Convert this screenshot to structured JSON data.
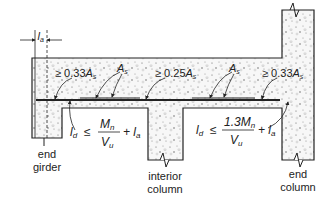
{
  "diagram": {
    "dimension_label": "l",
    "dimension_sub": "a",
    "labels": {
      "left_top": {
        "prefix": "≥ 0.33",
        "var": "A",
        "sub": "s"
      },
      "mid_top": {
        "prefix": "≥ 0.25",
        "var": "A",
        "sub": "s"
      },
      "right_top": {
        "prefix": "≥ 0.33",
        "var": "A",
        "sub": "s"
      },
      "as_left": {
        "var": "A",
        "sub": "s"
      },
      "as_right": {
        "var": "A",
        "sub": "s"
      }
    },
    "eq_left": {
      "lhs": "l",
      "lhs_sub": "d",
      "rel": "≤",
      "num": "M",
      "num_sub": "n",
      "den": "V",
      "den_sub": "u",
      "plus": "+ l",
      "plus_sub": "a"
    },
    "eq_right": {
      "lhs": "l",
      "lhs_sub": "d",
      "rel": "≤",
      "num": "1.3M",
      "num_sub": "n",
      "den": "V",
      "den_sub": "u",
      "plus": "+ l",
      "plus_sub": "a"
    },
    "supports": {
      "end_girder": [
        "end",
        "girder"
      ],
      "interior_column": [
        "interior",
        "column"
      ],
      "end_column": [
        "end",
        "column"
      ]
    },
    "colors": {
      "line": "#222222",
      "speckle": "#9a9a9a",
      "fill": "#f4f4f4"
    }
  }
}
